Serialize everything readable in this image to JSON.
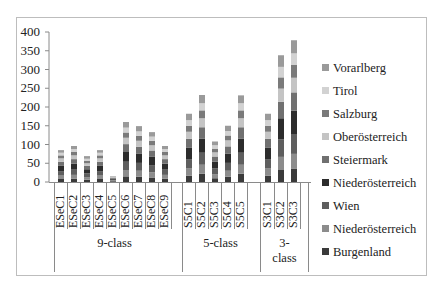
{
  "chart_data": {
    "type": "bar",
    "stacked": true,
    "title": "",
    "xlabel": "",
    "ylabel": "",
    "ylim": [
      0,
      400
    ],
    "yticks": [
      0,
      50,
      100,
      150,
      200,
      250,
      300,
      350,
      400
    ],
    "grid": false,
    "legend_position": "right",
    "categories": [
      "ESeC1",
      "ESeC2",
      "ESeC3",
      "ESeC4",
      "ESeC5",
      "ESeC6",
      "ESeC7",
      "ESeC8",
      "ESeC9",
      "S5C1",
      "S5C2",
      "S5C3",
      "S5C4",
      "S5C5",
      "S3C1",
      "S3C2",
      "S3C3"
    ],
    "groups": [
      {
        "label": "9-class",
        "members": [
          "ESeC1",
          "ESeC2",
          "ESeC3",
          "ESeC4",
          "ESeC5",
          "ESeC6",
          "ESeC7",
          "ESeC8",
          "ESeC9"
        ]
      },
      {
        "label": "5-class",
        "members": [
          "S5C1",
          "S5C2",
          "S5C3",
          "S5C4",
          "S5C5"
        ]
      },
      {
        "label": "3-class",
        "members": [
          "S3C1",
          "S3C2",
          "S3C3"
        ]
      }
    ],
    "totals": [
      85,
      96,
      69,
      85,
      16,
      160,
      149,
      133,
      96,
      182,
      232,
      108,
      150,
      231,
      182,
      338,
      378
    ],
    "series": [
      {
        "name": "Burgenland",
        "color": "#3a3a3a",
        "values": [
          8,
          9,
          6,
          8,
          2,
          15,
          14,
          12,
          9,
          17,
          22,
          10,
          14,
          22,
          17,
          32,
          36
        ]
      },
      {
        "name": "Niederösterreich",
        "color": "#8c8c8c",
        "values": [
          9,
          10,
          7,
          9,
          2,
          17,
          16,
          14,
          10,
          19,
          24,
          11,
          16,
          24,
          19,
          35,
          39
        ]
      },
      {
        "name": "Wien",
        "color": "#5e5e5e",
        "values": [
          12,
          14,
          10,
          12,
          2,
          22,
          21,
          19,
          14,
          25,
          32,
          15,
          21,
          32,
          25,
          47,
          53
        ]
      },
      {
        "name": "Niederösterreich",
        "color": "#2c2c2c",
        "values": [
          14,
          16,
          11,
          14,
          3,
          26,
          24,
          22,
          16,
          30,
          38,
          18,
          25,
          38,
          30,
          56,
          62
        ]
      },
      {
        "name": "Steiermark",
        "color": "#707070",
        "values": [
          11,
          12,
          9,
          11,
          2,
          21,
          19,
          17,
          12,
          24,
          30,
          14,
          19,
          30,
          24,
          44,
          49
        ]
      },
      {
        "name": "Oberösterreich",
        "color": "#c4c4c4",
        "values": [
          9,
          10,
          7,
          9,
          2,
          17,
          16,
          14,
          10,
          19,
          24,
          11,
          16,
          24,
          19,
          35,
          39
        ]
      },
      {
        "name": "Salzburg",
        "color": "#7a7a7a",
        "values": [
          8,
          9,
          6,
          8,
          1,
          14,
          13,
          12,
          9,
          16,
          21,
          10,
          13,
          21,
          16,
          30,
          34
        ]
      },
      {
        "name": "Tirol",
        "color": "#d2d2d2",
        "values": [
          7,
          8,
          6,
          7,
          1,
          13,
          12,
          11,
          8,
          15,
          19,
          9,
          12,
          19,
          15,
          28,
          31
        ]
      },
      {
        "name": "Vorarlberg",
        "color": "#9a9a9a",
        "values": [
          7,
          8,
          7,
          7,
          1,
          15,
          14,
          12,
          8,
          17,
          22,
          10,
          14,
          21,
          17,
          31,
          35
        ]
      }
    ]
  },
  "legend": {
    "items": [
      {
        "label": "Vorarlberg",
        "color": "#9a9a9a"
      },
      {
        "label": "Tirol",
        "color": "#d2d2d2"
      },
      {
        "label": "Salzburg",
        "color": "#7a7a7a"
      },
      {
        "label": "Oberösterreich",
        "color": "#c4c4c4"
      },
      {
        "label": "Steiermark",
        "color": "#707070"
      },
      {
        "label": "Niederösterreich",
        "color": "#2c2c2c"
      },
      {
        "label": "Wien",
        "color": "#5e5e5e"
      },
      {
        "label": "Niederösterreich",
        "color": "#8c8c8c"
      },
      {
        "label": "Burgenland",
        "color": "#3a3a3a"
      }
    ]
  },
  "axis": {
    "ytick_labels": [
      "0",
      "50",
      "100",
      "150",
      "200",
      "250",
      "300",
      "350",
      "400"
    ]
  },
  "group_labels": {
    "g9": "9-class",
    "g5": "5-class",
    "g3a": "3-",
    "g3b": "class"
  }
}
